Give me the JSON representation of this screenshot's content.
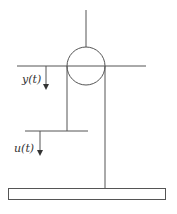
{
  "diagram": {
    "type": "pulley-system",
    "labels": {
      "y": "y(t)",
      "u": "u(t)"
    },
    "colors": {
      "stroke": "#555555",
      "background": "#ffffff"
    }
  }
}
